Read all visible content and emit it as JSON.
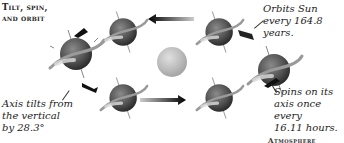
{
  "diagram": {
    "title_line1": "Tilt, spin,",
    "title_line2": "and orbit",
    "captions": {
      "orbit": [
        "Orbits Sun",
        "every 164.8 years."
      ],
      "spin": [
        "Spins on its",
        "axis once every",
        "16.11 hours."
      ],
      "tilt": [
        "Axis tilts from",
        "the vertical",
        "by 28.3°"
      ]
    },
    "footer_label": "Atmosphere",
    "icons": {
      "planet": "tilted-ringed-planet-icon",
      "sun": "sun-icon",
      "arrow": "orbit-arrow-icon"
    },
    "colors": {
      "planet_dark": "#3e3e3e",
      "planet_mid": "#6a6a6a",
      "ring": "#8a8a8a",
      "sun": "#bdbdbd",
      "text": "#222222"
    }
  }
}
